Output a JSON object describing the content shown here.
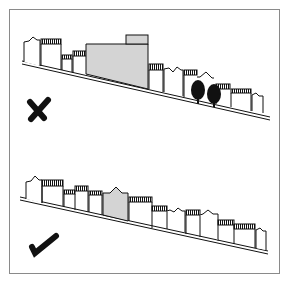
{
  "diagram": {
    "frame": {
      "x": 9,
      "y": 9,
      "width": 271,
      "height": 265,
      "stroke": "#8a8a8a"
    },
    "colors": {
      "ink": "#111111",
      "fill_highlight": "#d4d4d4",
      "background": "#ffffff"
    },
    "panels": [
      {
        "id": "incorrect",
        "verdict": "wrong",
        "mark_icon": "cross-mark",
        "description": "Oversized out-of-scale building breaks the stepped roofline of the street on a slope; trees present"
      },
      {
        "id": "correct",
        "verdict": "right",
        "mark_icon": "check-mark",
        "description": "New building follows the scale and stepping of adjacent terraced houses along the slope"
      }
    ]
  }
}
